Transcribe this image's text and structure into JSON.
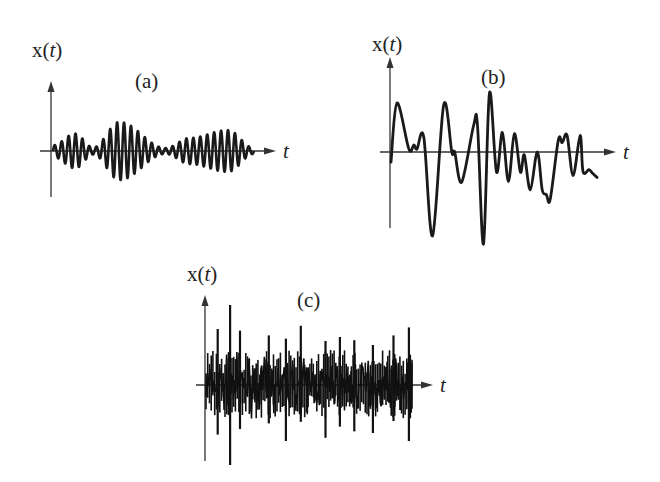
{
  "figure": {
    "panels": [
      {
        "id": "a",
        "panel_label": "(a)",
        "ylabel": "x(",
        "ylabel_var": "t",
        "ylabel_close": ")",
        "xlabel": "t",
        "kind": "amplitude-modulated sinusoid",
        "cycles": 29,
        "envelope": [
          {
            "t": 0.0,
            "a": 0.2
          },
          {
            "t": 0.11,
            "a": 0.6
          },
          {
            "t": 0.2,
            "a": 0.12
          },
          {
            "t": 0.33,
            "a": 1.0
          },
          {
            "t": 0.56,
            "a": 0.1
          },
          {
            "t": 0.68,
            "a": 0.45
          },
          {
            "t": 0.87,
            "a": 0.72
          },
          {
            "t": 1.0,
            "a": 0.1
          }
        ]
      },
      {
        "id": "b",
        "panel_label": "(b)",
        "ylabel": "x(",
        "ylabel_var": "t",
        "ylabel_close": ")",
        "xlabel": "t",
        "kind": "irregular transient",
        "samples": [
          [
            0.0,
            -0.17
          ],
          [
            0.029,
            0.83
          ],
          [
            0.087,
            0.05
          ],
          [
            0.111,
            0.12
          ],
          [
            0.126,
            0.05
          ],
          [
            0.159,
            0.25
          ],
          [
            0.202,
            -1.42
          ],
          [
            0.256,
            0.8
          ],
          [
            0.295,
            0.0
          ],
          [
            0.309,
            0.0
          ],
          [
            0.343,
            -0.51
          ],
          [
            0.401,
            0.45
          ],
          [
            0.42,
            0.45
          ],
          [
            0.449,
            -1.56
          ],
          [
            0.478,
            1.0
          ],
          [
            0.512,
            -0.34
          ],
          [
            0.541,
            0.33
          ],
          [
            0.57,
            -0.5
          ],
          [
            0.599,
            0.31
          ],
          [
            0.628,
            -0.34
          ],
          [
            0.647,
            -0.05
          ],
          [
            0.676,
            -0.64
          ],
          [
            0.71,
            0.0
          ],
          [
            0.734,
            -0.64
          ],
          [
            0.754,
            -0.72
          ],
          [
            0.773,
            -0.8
          ],
          [
            0.812,
            0.2
          ],
          [
            0.831,
            0.16
          ],
          [
            0.855,
            0.28
          ],
          [
            0.884,
            -0.4
          ],
          [
            0.918,
            0.28
          ],
          [
            0.932,
            -0.33
          ],
          [
            0.961,
            -0.3
          ],
          [
            0.981,
            -0.37
          ],
          [
            1.0,
            -0.43
          ]
        ]
      },
      {
        "id": "c",
        "panel_label": "(c)",
        "ylabel": "x(",
        "ylabel_var": "t",
        "ylabel_close": ")",
        "xlabel": "t",
        "kind": "random noise",
        "seed": 7,
        "points": 240,
        "spikes": [
          [
            0.057,
            0.7,
            -0.62
          ],
          [
            0.117,
            1.0,
            -1.0
          ],
          [
            0.165,
            0.68,
            -0.55
          ],
          [
            0.305,
            0.62,
            -0.48
          ],
          [
            0.388,
            0.58,
            -0.7
          ],
          [
            0.46,
            0.74,
            -0.46
          ],
          [
            0.58,
            0.55,
            -0.66
          ],
          [
            0.65,
            0.6,
            -0.52
          ],
          [
            0.72,
            0.56,
            -0.58
          ],
          [
            0.81,
            0.5,
            -0.6
          ],
          [
            0.91,
            0.62,
            -0.45
          ],
          [
            0.985,
            0.72,
            -0.7
          ]
        ]
      }
    ]
  }
}
